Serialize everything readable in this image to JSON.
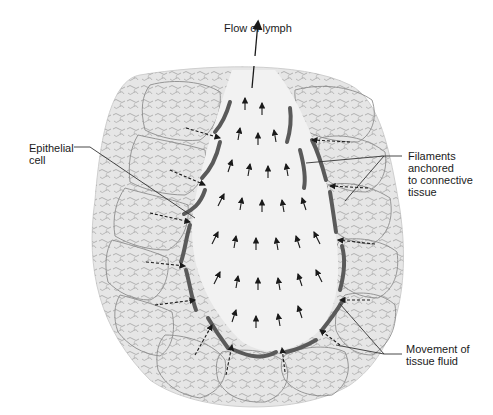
{
  "diagram": {
    "labels": {
      "flow": "Flow of lymph",
      "epithelial": "Epithelial\ncell",
      "filaments": "Filaments\nanchored\nto connective\ntissue",
      "movement": "Movement of\ntissue fluid"
    },
    "colors": {
      "background": "#ffffff",
      "tissue_fill": "#e4e4e4",
      "cell_outline": "#8a8a8a",
      "lumen_fill": "#f1f1f1",
      "epithelial_cell": "#5a5a5a",
      "arrow": "#1a1a1a",
      "leader_line": "#333333",
      "text": "#1a1a1a"
    }
  }
}
